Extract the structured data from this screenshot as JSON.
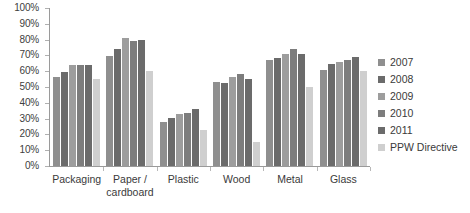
{
  "chart_data": {
    "type": "bar",
    "title": "",
    "subtitle": "",
    "xlabel": "",
    "ylabel": "",
    "ylim": [
      0,
      100
    ],
    "y_ticks": [
      "0%",
      "10%",
      "20%",
      "30%",
      "40%",
      "50%",
      "60%",
      "70%",
      "80%",
      "90%",
      "100%"
    ],
    "y_tick_values": [
      0,
      10,
      20,
      30,
      40,
      50,
      60,
      70,
      80,
      90,
      100
    ],
    "grid": false,
    "legend_position": "right",
    "categories": [
      "Packaging",
      "Paper / cardboard",
      "Plastic",
      "Wood",
      "Metal",
      "Glass"
    ],
    "category_lines": [
      [
        "Packaging"
      ],
      [
        "Paper /",
        "cardboard"
      ],
      [
        "Plastic"
      ],
      [
        "Wood"
      ],
      [
        "Metal"
      ],
      [
        "Glass"
      ]
    ],
    "series": [
      {
        "name": "2007",
        "color": "#8f8f8f",
        "values": [
          56.5,
          69.5,
          28.0,
          53.0,
          67.0,
          60.5
        ]
      },
      {
        "name": "2008",
        "color": "#6b6b6b",
        "values": [
          59.5,
          74.0,
          30.5,
          52.5,
          68.5,
          64.5
        ]
      },
      {
        "name": "2009",
        "color": "#9d9d9d",
        "values": [
          64.0,
          81.0,
          33.0,
          56.5,
          71.0,
          66.0
        ]
      },
      {
        "name": "2010",
        "color": "#7d7d7d",
        "values": [
          64.0,
          79.0,
          33.5,
          58.0,
          74.0,
          67.0
        ]
      },
      {
        "name": "2011",
        "color": "#6b6b6b",
        "values": [
          64.0,
          79.5,
          36.0,
          55.0,
          71.0,
          69.0
        ]
      },
      {
        "name": "PPW Directive",
        "color": "#cfcfcf",
        "values": [
          55.0,
          60.0,
          22.5,
          15.0,
          50.0,
          60.0
        ]
      }
    ]
  },
  "legend": {
    "items": [
      {
        "label": "2007"
      },
      {
        "label": "2008"
      },
      {
        "label": "2009"
      },
      {
        "label": "2010"
      },
      {
        "label": "2011"
      },
      {
        "label": "PPW Directive"
      }
    ]
  }
}
